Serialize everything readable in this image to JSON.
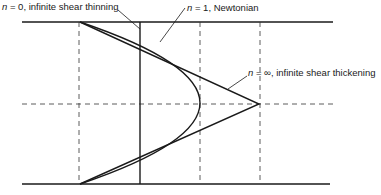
{
  "diagram": {
    "labels": {
      "thinning": {
        "n_symbol": "n",
        "text": " = 0, infinite shear thinning"
      },
      "newtonian": {
        "n_symbol": "n",
        "text": " = 1, Newtonian"
      },
      "thickening": {
        "n_symbol": "n",
        "text": " = ∞, infinite shear thickening"
      }
    },
    "curves": [
      {
        "name": "infinite-shear-thinning",
        "shape": "vertical line (plug flow)"
      },
      {
        "name": "newtonian",
        "shape": "parabola"
      },
      {
        "name": "infinite-shear-thickening",
        "shape": "triangle (linear)"
      }
    ],
    "colors": {
      "line": "#1a1a1a",
      "background": "#ffffff"
    }
  }
}
